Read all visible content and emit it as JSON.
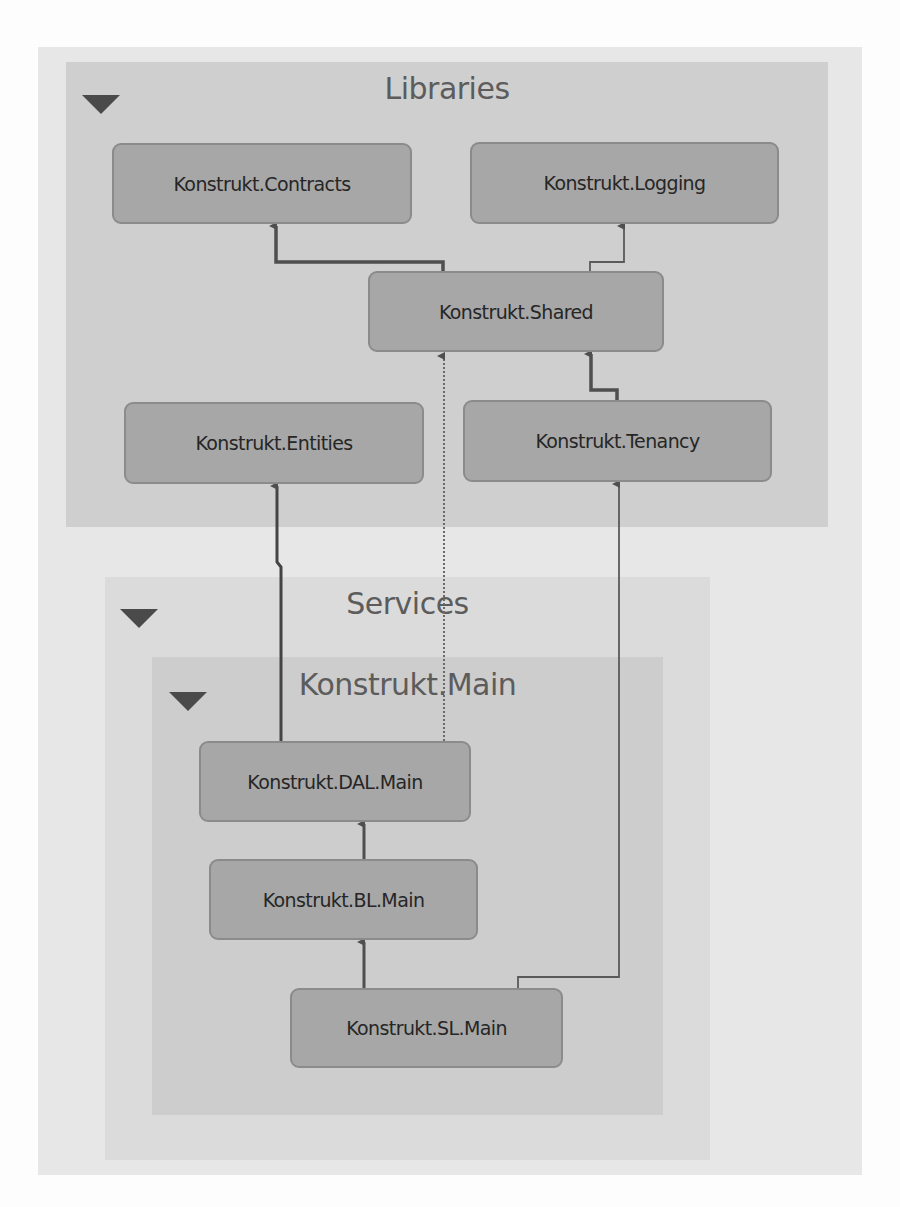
{
  "diagram": {
    "groups": {
      "libraries": {
        "title": "Libraries",
        "collapse_icon": "triangle-down-icon"
      },
      "services": {
        "title": "Services",
        "collapse_icon": "triangle-down-icon"
      },
      "konstrukt_main": {
        "title": "Konstrukt.Main",
        "collapse_icon": "triangle-down-icon"
      }
    },
    "nodes": {
      "contracts": {
        "label": "Konstrukt.Contracts",
        "group": "Libraries"
      },
      "logging": {
        "label": "Konstrukt.Logging",
        "group": "Libraries"
      },
      "shared": {
        "label": "Konstrukt.Shared",
        "group": "Libraries"
      },
      "entities": {
        "label": "Konstrukt.Entities",
        "group": "Libraries"
      },
      "tenancy": {
        "label": "Konstrukt.Tenancy",
        "group": "Libraries"
      },
      "dal_main": {
        "label": "Konstrukt.DAL.Main",
        "group": "Konstrukt.Main"
      },
      "bl_main": {
        "label": "Konstrukt.BL.Main",
        "group": "Konstrukt.Main"
      },
      "sl_main": {
        "label": "Konstrukt.SL.Main",
        "group": "Konstrukt.Main"
      }
    },
    "edges": [
      {
        "from": "Konstrukt.Shared",
        "to": "Konstrukt.Contracts",
        "style": "solid-thick"
      },
      {
        "from": "Konstrukt.Shared",
        "to": "Konstrukt.Logging",
        "style": "solid-thin"
      },
      {
        "from": "Konstrukt.Tenancy",
        "to": "Konstrukt.Shared",
        "style": "solid-thick"
      },
      {
        "from": "Konstrukt.DAL.Main",
        "to": "Konstrukt.Entities",
        "style": "solid-thick"
      },
      {
        "from": "Konstrukt.DAL.Main",
        "to": "Konstrukt.Shared",
        "style": "dotted"
      },
      {
        "from": "Konstrukt.BL.Main",
        "to": "Konstrukt.DAL.Main",
        "style": "solid-thick"
      },
      {
        "from": "Konstrukt.SL.Main",
        "to": "Konstrukt.BL.Main",
        "style": "solid-thick"
      },
      {
        "from": "Konstrukt.SL.Main",
        "to": "Konstrukt.Tenancy",
        "style": "solid-thin"
      }
    ],
    "colors": {
      "outer_panel": "#e7e7e7",
      "libraries_group": "#cfcfcf",
      "services_group": "#dbdbdb",
      "main_group": "#cdcdcd",
      "node_fill": "#a7a7a7",
      "node_border": "#8b8b8b",
      "edge": "#4f4f4f"
    }
  }
}
